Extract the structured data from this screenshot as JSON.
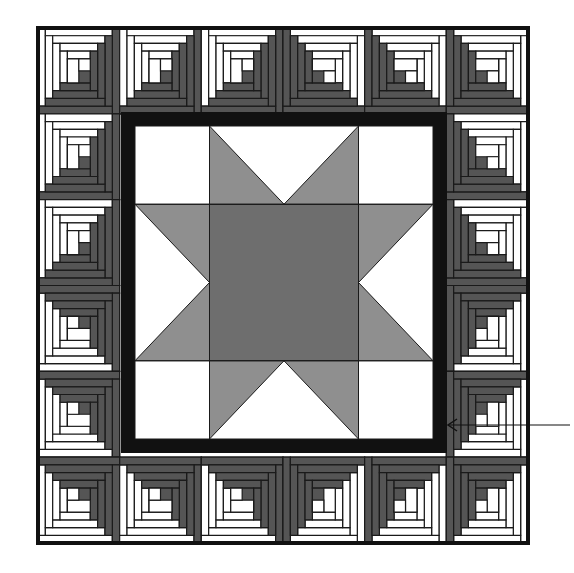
{
  "figure": {
    "description": "Quilt diagram: Sawtooth star center with black inner border surrounded by log cabin blocks",
    "canvas": {
      "width": 574,
      "height": 573
    },
    "colors": {
      "black": "#111111",
      "dark": "#555555",
      "medium": "#8a8a8a",
      "light": "#ffffff",
      "line": "#1a1a1a"
    },
    "outer_frame": {
      "x": 38,
      "y": 28,
      "w": 490,
      "h": 515,
      "stroke": 4
    },
    "grid": {
      "cols": 6,
      "rows": 6
    },
    "log_cabin_blocks": [
      {
        "row": 0,
        "col": 0,
        "rot": 0
      },
      {
        "row": 0,
        "col": 1,
        "rot": 0
      },
      {
        "row": 0,
        "col": 2,
        "rot": 0
      },
      {
        "row": 0,
        "col": 3,
        "rot": 90
      },
      {
        "row": 0,
        "col": 4,
        "rot": 90
      },
      {
        "row": 0,
        "col": 5,
        "rot": 90
      },
      {
        "row": 1,
        "col": 0,
        "rot": 0
      },
      {
        "row": 1,
        "col": 5,
        "rot": 90
      },
      {
        "row": 2,
        "col": 0,
        "rot": 0
      },
      {
        "row": 2,
        "col": 5,
        "rot": 90
      },
      {
        "row": 3,
        "col": 0,
        "rot": 270
      },
      {
        "row": 3,
        "col": 5,
        "rot": 180
      },
      {
        "row": 4,
        "col": 0,
        "rot": 270
      },
      {
        "row": 4,
        "col": 5,
        "rot": 180
      },
      {
        "row": 5,
        "col": 0,
        "rot": 270
      },
      {
        "row": 5,
        "col": 1,
        "rot": 270
      },
      {
        "row": 5,
        "col": 2,
        "rot": 270
      },
      {
        "row": 5,
        "col": 3,
        "rot": 180
      },
      {
        "row": 5,
        "col": 4,
        "rot": 180
      },
      {
        "row": 5,
        "col": 5,
        "rot": 180
      }
    ],
    "inner_border": {
      "x": 121,
      "y": 112,
      "w": 326,
      "h": 341,
      "thickness": 14
    },
    "star_block": {
      "x": 135,
      "y": 126,
      "w": 298,
      "h": 313,
      "center_square_color": "#6e6e6e",
      "star_point_color": "#8f8f8f",
      "background_color": "#ffffff"
    },
    "arrow": {
      "x1": 570,
      "y1": 425,
      "x2": 448,
      "y2": 425,
      "label": ""
    }
  }
}
